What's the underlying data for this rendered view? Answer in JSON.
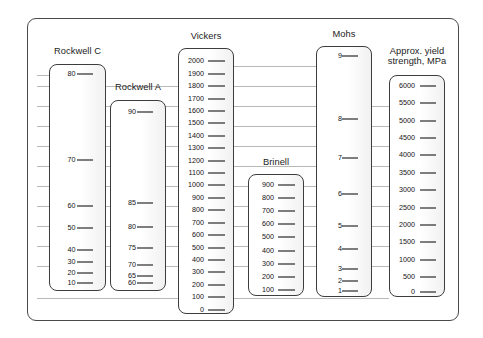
{
  "figure": {
    "type": "comparison-scale-chart",
    "title": "",
    "frame_color": "#4a4a4a",
    "gridline_color": "#b9b9b9",
    "tick_color": "#000000"
  },
  "chart_data": {
    "type": "table",
    "title": "",
    "subtitle": "",
    "xlabel": "",
    "ylabel": "",
    "grid": true,
    "legend": "none",
    "series": [
      {
        "name": "Rockwell C",
        "unit": "",
        "values": [
          80,
          70,
          60,
          50,
          40,
          30,
          20,
          10
        ],
        "labels": [
          "80",
          "70",
          "60",
          "50",
          "40",
          "30",
          "20",
          "10"
        ],
        "positions_pct": [
          4.0,
          42.0,
          62.5,
          72.5,
          82.0,
          87.5,
          92.5,
          97.0
        ]
      },
      {
        "name": "Rockwell A",
        "unit": "",
        "values": [
          90,
          85,
          80,
          75,
          70,
          65,
          60
        ],
        "labels": [
          "90",
          "85",
          "80",
          "75",
          "70",
          "65",
          "60"
        ],
        "positions_pct": [
          6.0,
          54.0,
          66.5,
          78.0,
          87.0,
          92.5,
          96.5
        ]
      },
      {
        "name": "Vickers",
        "unit": "",
        "values": [
          2000,
          1900,
          1800,
          1700,
          1600,
          1500,
          1400,
          1300,
          1200,
          1100,
          1000,
          900,
          800,
          700,
          600,
          500,
          400,
          300,
          200,
          100,
          0
        ],
        "labels": [
          "2000",
          "1900",
          "1800",
          "1700",
          "1600",
          "1500",
          "1400",
          "1300",
          "1200",
          "1100",
          "1000",
          "900",
          "800",
          "700",
          "600",
          "500",
          "400",
          "300",
          "200",
          "100",
          "0"
        ],
        "positions_pct": [
          4.7,
          9.4,
          14.1,
          18.8,
          23.5,
          28.2,
          32.9,
          37.6,
          42.3,
          47.0,
          51.7,
          56.4,
          61.1,
          65.8,
          70.5,
          75.2,
          79.9,
          84.6,
          89.3,
          94.0,
          98.7
        ]
      },
      {
        "name": "Brinell",
        "unit": "",
        "values": [
          900,
          800,
          700,
          600,
          500,
          400,
          300,
          200,
          100
        ],
        "labels": [
          "900",
          "800",
          "700",
          "600",
          "500",
          "400",
          "300",
          "200",
          "100"
        ],
        "positions_pct": [
          8.0,
          19.0,
          30.0,
          41.0,
          52.0,
          63.0,
          74.0,
          85.0,
          96.0
        ]
      },
      {
        "name": "Mohs",
        "unit": "",
        "values": [
          9,
          8,
          7,
          6,
          5,
          4,
          3,
          2,
          1
        ],
        "labels": [
          "9",
          "8",
          "7",
          "6",
          "5",
          "4",
          "3",
          "2",
          "1"
        ],
        "positions_pct": [
          3.5,
          29.0,
          44.5,
          59.0,
          72.0,
          81.0,
          89.0,
          94.0,
          98.0
        ]
      },
      {
        "name": "Approx. yield strength, MPa",
        "unit": "MPa",
        "values": [
          6000,
          5500,
          5000,
          4500,
          4000,
          3500,
          3000,
          2500,
          2000,
          1500,
          1000,
          500,
          0
        ],
        "labels": [
          "6000",
          "5500",
          "5000",
          "4500",
          "4000",
          "3500",
          "3000",
          "2500",
          "2000",
          "1500",
          "1000",
          "500",
          "0"
        ],
        "positions_pct": [
          4.5,
          12.4,
          20.3,
          28.2,
          36.1,
          44.0,
          51.9,
          59.8,
          67.7,
          75.6,
          83.5,
          91.4,
          98.0
        ]
      }
    ],
    "gridlines_y": [
      66,
      86,
      106,
      126,
      146,
      166,
      186,
      206,
      226,
      246,
      266,
      298
    ]
  },
  "scales": [
    {
      "id": "rockwellc",
      "title": "Rockwell C",
      "title_lines": [
        "Rockwell C"
      ],
      "box": {
        "left": 49,
        "top": 64,
        "width": 57,
        "height": 227
      },
      "title_top": 46,
      "ticks": [
        {
          "label": "80",
          "y_pct": 4.0
        },
        {
          "label": "70",
          "y_pct": 42.0
        },
        {
          "label": "60",
          "y_pct": 62.5
        },
        {
          "label": "50",
          "y_pct": 72.5
        },
        {
          "label": "40",
          "y_pct": 82.0
        },
        {
          "label": "30",
          "y_pct": 87.5
        },
        {
          "label": "20",
          "y_pct": 92.5
        },
        {
          "label": "10",
          "y_pct": 97.0
        }
      ]
    },
    {
      "id": "rockwella",
      "title": "Rockwell A",
      "title_lines": [
        "Rockwell A"
      ],
      "box": {
        "left": 110,
        "top": 100,
        "width": 56,
        "height": 191
      },
      "title_top": 82,
      "ticks": [
        {
          "label": "90",
          "y_pct": 6.0
        },
        {
          "label": "85",
          "y_pct": 54.0
        },
        {
          "label": "80",
          "y_pct": 66.5
        },
        {
          "label": "75",
          "y_pct": 78.0
        },
        {
          "label": "70",
          "y_pct": 87.0
        },
        {
          "label": "65",
          "y_pct": 92.5
        },
        {
          "label": "60",
          "y_pct": 96.5
        }
      ]
    },
    {
      "id": "vickers",
      "title": "Vickers",
      "title_lines": [
        "Vickers"
      ],
      "box": {
        "left": 178,
        "top": 48,
        "width": 56,
        "height": 266
      },
      "title_top": 31,
      "ticks": [
        {
          "label": "2000",
          "y_pct": 4.7
        },
        {
          "label": "1900",
          "y_pct": 9.4
        },
        {
          "label": "1800",
          "y_pct": 14.1
        },
        {
          "label": "1700",
          "y_pct": 18.8
        },
        {
          "label": "1600",
          "y_pct": 23.5
        },
        {
          "label": "1500",
          "y_pct": 28.2
        },
        {
          "label": "1400",
          "y_pct": 32.9
        },
        {
          "label": "1300",
          "y_pct": 37.6
        },
        {
          "label": "1200",
          "y_pct": 42.3
        },
        {
          "label": "1100",
          "y_pct": 47.0
        },
        {
          "label": "1000",
          "y_pct": 51.7
        },
        {
          "label": "900",
          "y_pct": 56.4
        },
        {
          "label": "800",
          "y_pct": 61.1
        },
        {
          "label": "700",
          "y_pct": 65.8
        },
        {
          "label": "600",
          "y_pct": 70.5
        },
        {
          "label": "500",
          "y_pct": 75.2
        },
        {
          "label": "400",
          "y_pct": 79.9
        },
        {
          "label": "300",
          "y_pct": 84.6
        },
        {
          "label": "200",
          "y_pct": 89.3
        },
        {
          "label": "100",
          "y_pct": 94.0
        },
        {
          "label": "0",
          "y_pct": 98.7
        }
      ]
    },
    {
      "id": "brinell",
      "title": "Brinell",
      "title_lines": [
        "Brinell"
      ],
      "box": {
        "left": 248,
        "top": 174,
        "width": 56,
        "height": 122
      },
      "title_top": 157,
      "ticks": [
        {
          "label": "900",
          "y_pct": 8.0
        },
        {
          "label": "800",
          "y_pct": 19.0
        },
        {
          "label": "700",
          "y_pct": 30.0
        },
        {
          "label": "600",
          "y_pct": 41.0
        },
        {
          "label": "500",
          "y_pct": 52.0
        },
        {
          "label": "400",
          "y_pct": 63.0
        },
        {
          "label": "300",
          "y_pct": 74.0
        },
        {
          "label": "200",
          "y_pct": 85.0
        },
        {
          "label": "100",
          "y_pct": 96.0
        }
      ]
    },
    {
      "id": "mohs",
      "title": "Mohs",
      "title_lines": [
        "Mohs"
      ],
      "box": {
        "left": 316,
        "top": 46,
        "width": 56,
        "height": 251
      },
      "title_top": 29,
      "ticks": [
        {
          "label": "9",
          "y_pct": 3.5
        },
        {
          "label": "8",
          "y_pct": 29.0
        },
        {
          "label": "7",
          "y_pct": 44.5
        },
        {
          "label": "6",
          "y_pct": 59.0
        },
        {
          "label": "5",
          "y_pct": 72.0
        },
        {
          "label": "4",
          "y_pct": 81.0
        },
        {
          "label": "3",
          "y_pct": 89.0
        },
        {
          "label": "2",
          "y_pct": 94.0
        },
        {
          "label": "1",
          "y_pct": 98.0
        }
      ]
    },
    {
      "id": "yield",
      "title": "Approx. yield strength, MPa",
      "title_lines": [
        "Approx. yield",
        "strength, MPa"
      ],
      "box": {
        "left": 389,
        "top": 75,
        "width": 56,
        "height": 222
      },
      "title_top": 46,
      "ticks": [
        {
          "label": "6000",
          "y_pct": 4.5
        },
        {
          "label": "5500",
          "y_pct": 12.4
        },
        {
          "label": "5000",
          "y_pct": 20.3
        },
        {
          "label": "4500",
          "y_pct": 28.2
        },
        {
          "label": "4000",
          "y_pct": 36.1
        },
        {
          "label": "3500",
          "y_pct": 44.0
        },
        {
          "label": "3000",
          "y_pct": 51.9
        },
        {
          "label": "2500",
          "y_pct": 59.8
        },
        {
          "label": "2000",
          "y_pct": 67.7
        },
        {
          "label": "1500",
          "y_pct": 75.6
        },
        {
          "label": "1000",
          "y_pct": 83.5
        },
        {
          "label": "500",
          "y_pct": 91.4
        },
        {
          "label": "0",
          "y_pct": 98.0
        }
      ]
    }
  ],
  "gridlines": [
    {
      "y": 66,
      "left": 234,
      "right": 316
    },
    {
      "y": 75,
      "left": 37,
      "right": 49
    },
    {
      "y": 86,
      "left": 37,
      "right": 316
    },
    {
      "y": 106,
      "left": 37,
      "right": 389
    },
    {
      "y": 126,
      "left": 37,
      "right": 389
    },
    {
      "y": 146,
      "left": 37,
      "right": 389
    },
    {
      "y": 166,
      "left": 37,
      "right": 389
    },
    {
      "y": 186,
      "left": 37,
      "right": 389
    },
    {
      "y": 206,
      "left": 37,
      "right": 389
    },
    {
      "y": 226,
      "left": 37,
      "right": 389
    },
    {
      "y": 246,
      "left": 37,
      "right": 389
    },
    {
      "y": 266,
      "left": 37,
      "right": 389
    },
    {
      "y": 298,
      "left": 37,
      "right": 389
    }
  ]
}
